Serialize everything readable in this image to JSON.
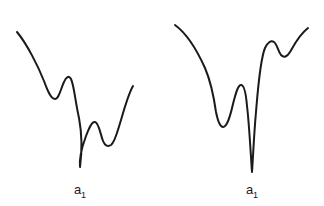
{
  "figure": {
    "background_color": "#ffffff",
    "stroke_color": "#1a1a1a",
    "stroke_width": 2,
    "width": 324,
    "height": 206
  },
  "panels": [
    {
      "id": "left-panel",
      "name": "single-deep-well-curve",
      "label_base": "a",
      "label_subscript": "1",
      "label_x": 80,
      "label_y": 194,
      "path": "M 17,32 C 27,44 38,66 44,81 C 48,92 51,99 55,99 C 59,99 61,88 64,82 C 66,77 69,75 71,79 C 74,85 75,100 79,118 C 82,134 82,152 80,167 C 79,158 82,147 86,136 C 89,128 92,121 95,122 C 99,123 100,133 103,141 C 105,146 108,147 111,145 C 115,142 117,133 121,120 C 125,106 129,93 133,86"
    },
    {
      "id": "right-panel",
      "name": "double-deep-well-curve",
      "label_base": "a",
      "label_subscript": "1",
      "label_x": 252,
      "label_y": 194,
      "path": "M 175,25 C 186,33 196,48 205,68 C 211,82 214,98 216,112 C 218,122 220,127 223,127 C 227,127 230,117 233,104 C 236,92 238,85 241,85 C 244,85 246,94 247,106 C 249,122 250,143 252,172 C 253,158 254,134 256,112 C 258,88 260,60 265,48 C 268,42 271,40 274,42 C 277,44 278,51 281,55 C 284,58 287,57 290,52 C 294,45 299,35 308,28"
    }
  ]
}
